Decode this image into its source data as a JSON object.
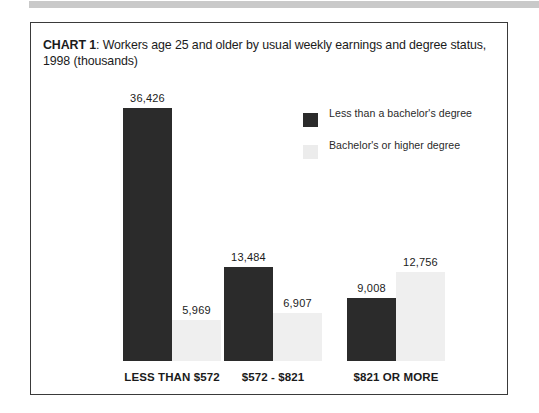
{
  "page": {
    "top_strip_color": "#c9c9c9",
    "frame_border_color": "#3a3a3a",
    "background": "#ffffff"
  },
  "chart_title": {
    "lead": "CHART 1",
    "rest": ": Workers age 25 and older by usual weekly earnings and degree status, 1998 (thousands)"
  },
  "legend": {
    "items": [
      {
        "label": "Less than a bachelor's degree",
        "color": "#2b2b2b",
        "swatch_name": "legend-swatch-less-than-bachelors"
      },
      {
        "label": "Bachelor's or higher degree",
        "color": "#ececec",
        "swatch_name": "legend-swatch-bachelors-or-higher"
      }
    ]
  },
  "chart_data": {
    "type": "bar",
    "title": "CHART 1: Workers age 25 and older by usual weekly earnings and degree status, 1998 (thousands)",
    "xlabel": "",
    "ylabel": "",
    "ylim": [
      0,
      36426
    ],
    "grid": false,
    "legend_position": "top-right",
    "categories": [
      "LESS THAN $572",
      "$572 - $821",
      "$821 OR MORE"
    ],
    "series": [
      {
        "name": "Less than a bachelor's degree",
        "color": "#2b2b2b",
        "values": [
          36426,
          13484,
          9008
        ],
        "labels": [
          "36,426",
          "13,484",
          "9,008"
        ]
      },
      {
        "name": "Bachelor's or higher degree",
        "color": "#efefef",
        "values": [
          5969,
          6907,
          12756
        ],
        "labels": [
          "5,969",
          "6,907",
          "12,756"
        ]
      }
    ]
  }
}
